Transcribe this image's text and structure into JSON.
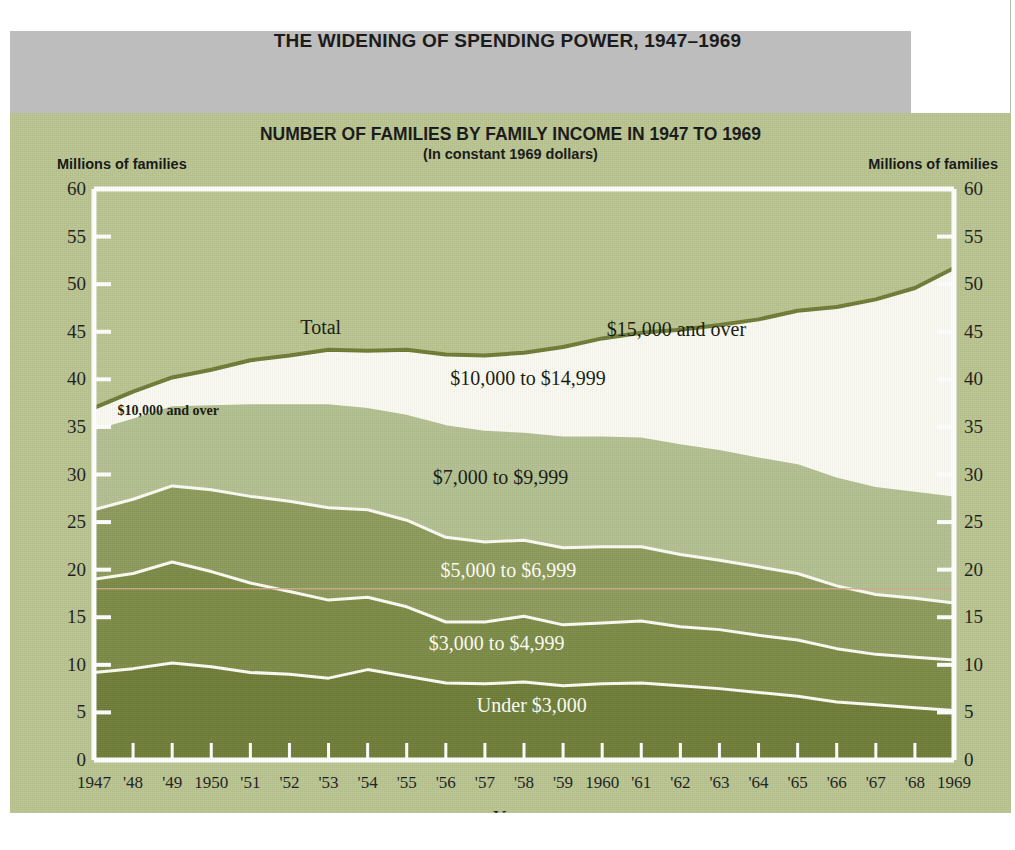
{
  "header": {
    "title": "THE WIDENING OF SPENDING POWER, 1947–1969",
    "band_color": "#bdbdbd"
  },
  "chart_panel": {
    "background_color": "#b9c48f",
    "title": "NUMBER OF FAMILIES BY FAMILY INCOME IN 1947 TO 1969",
    "subtitle": "(In constant 1969 dollars)",
    "unit_label_left": "Millions of families",
    "unit_label_right": "Millions of families"
  },
  "chart_data": {
    "type": "area",
    "title": "NUMBER OF FAMILIES BY FAMILY INCOME IN 1947 TO 1969",
    "subtitle": "(In constant 1969 dollars)",
    "xlabel": "Year",
    "ylabel": "Millions of families",
    "ylabel_right": "Millions of families",
    "ylim": [
      0,
      60
    ],
    "ytick_step": 5,
    "yticks": [
      0,
      5,
      10,
      15,
      20,
      25,
      30,
      35,
      40,
      45,
      50,
      55,
      60
    ],
    "ytick_labels": [
      "0",
      "5",
      "10",
      "15",
      "20",
      "25",
      "30",
      "35",
      "40",
      "45",
      "50",
      "55",
      "60"
    ],
    "grid": false,
    "stacked": true,
    "legend_position": "in-plot annotations",
    "x": [
      1947,
      1948,
      1949,
      1950,
      1951,
      1952,
      1953,
      1954,
      1955,
      1956,
      1957,
      1958,
      1959,
      1960,
      1961,
      1962,
      1963,
      1964,
      1965,
      1966,
      1967,
      1968,
      1969
    ],
    "xtick_labels": [
      "1947",
      "'48",
      "'49",
      "1950",
      "'51",
      "'52",
      "'53",
      "'54",
      "'55",
      "'56",
      "'57",
      "'58",
      "'59",
      "1960",
      "'61",
      "'62",
      "'63",
      "'64",
      "'65",
      "'66",
      "'67",
      "'68",
      "1969"
    ],
    "series": [
      {
        "name": "Under $3,000",
        "label": "Under $3,000",
        "color": "#6e7d36",
        "label_color": "#fdfdf6",
        "values": [
          9.2,
          9.6,
          10.2,
          9.8,
          9.2,
          9.0,
          8.6,
          9.5,
          8.8,
          8.1,
          8.0,
          8.2,
          7.8,
          8.0,
          8.1,
          7.8,
          7.5,
          7.1,
          6.7,
          6.1,
          5.8,
          5.5,
          5.2
        ]
      },
      {
        "name": "$3,000 to $4,999",
        "label": "$3,000 to $4,999",
        "color": "#7b8a44",
        "label_color": "#fdfdf6",
        "values": [
          9.8,
          10.0,
          10.6,
          10.0,
          9.4,
          8.7,
          8.2,
          7.6,
          7.3,
          6.4,
          6.5,
          6.9,
          6.4,
          6.4,
          6.5,
          6.2,
          6.2,
          6.0,
          5.9,
          5.6,
          5.3,
          5.3,
          5.3
        ]
      },
      {
        "name": "$5,000 to $6,999",
        "label": "$5,000 to $6,999",
        "color": "#8c9a5a",
        "label_color": "#fdfdf6",
        "values": [
          7.3,
          7.8,
          8.0,
          8.6,
          9.1,
          9.5,
          9.7,
          9.2,
          9.1,
          8.9,
          8.4,
          8.0,
          8.1,
          8.0,
          7.8,
          7.6,
          7.3,
          7.2,
          7.0,
          6.6,
          6.3,
          6.2,
          6.0
        ]
      },
      {
        "name": "$7,000 to $9,999",
        "label": "$7,000 to $9,999",
        "color": "#b2bf90",
        "label_color": "#15180d",
        "values": [
          8.5,
          8.6,
          8.5,
          9.0,
          9.8,
          10.3,
          11.0,
          10.8,
          11.2,
          11.9,
          11.8,
          11.4,
          11.8,
          11.7,
          11.6,
          11.7,
          11.7,
          11.6,
          11.6,
          11.5,
          11.4,
          11.3,
          11.3
        ]
      },
      {
        "name": "$10,000 and over",
        "label": "$10,000 and over",
        "color": "#fafaf2",
        "label_color": "#15180d",
        "values": [
          2.2,
          2.7,
          2.9,
          3.6,
          4.5,
          5.0,
          5.6,
          5.9,
          6.7,
          7.3,
          7.8,
          8.3,
          9.3,
          10.2,
          10.9,
          11.9,
          13.0,
          14.4,
          16.0,
          17.8,
          19.6,
          21.3,
          23.9
        ]
      }
    ],
    "total": {
      "name": "Total",
      "label": "Total",
      "line_color": "#6e7b33",
      "values": [
        37.0,
        38.7,
        40.2,
        41.0,
        42.0,
        42.5,
        43.1,
        43.0,
        43.1,
        42.6,
        42.5,
        42.8,
        43.4,
        44.3,
        44.9,
        45.2,
        45.7,
        46.3,
        47.2,
        47.6,
        48.4,
        49.6,
        51.7
      ]
    },
    "annotations": [
      {
        "text": "Total",
        "x": 1952.8,
        "y": 45.4,
        "color": "#15180d"
      },
      {
        "text": "$15,000 and over",
        "x": 1961.9,
        "y": 45.2,
        "color": "#15180d"
      },
      {
        "text": "$10,000 to $14,999",
        "x": 1958.1,
        "y": 40.0,
        "color": "#15180d"
      },
      {
        "text": "$10,000 and over",
        "x": 1948.9,
        "y": 36.2,
        "color": "#15180d"
      },
      {
        "text": "$7,000 to $9,999",
        "x": 1957.4,
        "y": 29.6,
        "color": "#15180d"
      },
      {
        "text": "$5,000 to $6,999",
        "x": 1957.6,
        "y": 19.9,
        "color": "#fdfdf6"
      },
      {
        "text": "$3,000 to $4,999",
        "x": 1957.3,
        "y": 12.2,
        "color": "#fdfdf6"
      },
      {
        "text": "Under $3,000",
        "x": 1958.2,
        "y": 5.7,
        "color": "#fdfdf6"
      }
    ],
    "reference_line": {
      "y": 18.0,
      "color": "#d6a98a"
    }
  }
}
